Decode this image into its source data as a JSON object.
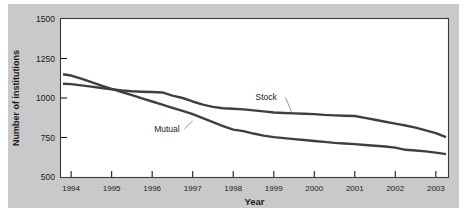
{
  "chart_data": {
    "type": "line",
    "title": "",
    "xlabel": "Year",
    "ylabel": "Number of institutions",
    "xlim": [
      1993.75,
      2003.3
    ],
    "ylim": [
      500,
      1500
    ],
    "ytick_values": [
      500,
      750,
      1000,
      1250,
      1500
    ],
    "ytick_labels": [
      "500",
      "750",
      "1000",
      "1250",
      "1500"
    ],
    "xtick_values": [
      1994,
      1995,
      1996,
      1997,
      1998,
      1999,
      2000,
      2001,
      2002,
      2003
    ],
    "xtick_labels": [
      "1994",
      "1995",
      "1996",
      "1997",
      "1998",
      "1999",
      "2000",
      "2001",
      "2002",
      "2003"
    ],
    "grid": false,
    "legend_position": "inline-annotations",
    "line_color": "#3f3f3f",
    "panel_color": "#c9c9c9",
    "plot_background": "#ffffff",
    "x": [
      1993.8,
      1994.0,
      1994.25,
      1994.5,
      1994.75,
      1995.0,
      1995.25,
      1995.5,
      1995.75,
      1996.0,
      1996.25,
      1996.5,
      1996.75,
      1997.0,
      1997.25,
      1997.5,
      1997.75,
      1998.0,
      1998.25,
      1998.5,
      1998.75,
      1999.0,
      1999.25,
      1999.5,
      1999.75,
      2000.0,
      2000.25,
      2000.5,
      2000.75,
      2001.0,
      2001.25,
      2001.5,
      2001.75,
      2002.0,
      2002.25,
      2002.5,
      2002.75,
      2003.0,
      2003.25
    ],
    "series": [
      {
        "name": "Stock",
        "label": "Stock",
        "values": [
          1090,
          1088,
          1080,
          1072,
          1063,
          1055,
          1048,
          1043,
          1040,
          1038,
          1035,
          1015,
          1000,
          978,
          958,
          944,
          935,
          932,
          928,
          922,
          915,
          908,
          905,
          903,
          900,
          898,
          893,
          890,
          888,
          886,
          874,
          862,
          850,
          838,
          826,
          812,
          795,
          778,
          752
        ]
      },
      {
        "name": "Mutual",
        "label": "Mutual",
        "values": [
          1150,
          1142,
          1122,
          1100,
          1078,
          1058,
          1038,
          1018,
          998,
          978,
          958,
          938,
          918,
          898,
          872,
          848,
          822,
          800,
          790,
          775,
          762,
          752,
          746,
          740,
          734,
          728,
          722,
          716,
          712,
          708,
          703,
          698,
          693,
          686,
          672,
          668,
          662,
          654,
          645
        ]
      }
    ],
    "annotations": [
      {
        "text": "Stock",
        "x": 1998.55,
        "y": 985,
        "leader_to_x": 1999.45,
        "leader_to_y": 905
      },
      {
        "text": "Mutual",
        "x": 1996.05,
        "y": 785,
        "leader_to_x": 1997.0,
        "leader_to_y": 855
      }
    ]
  }
}
